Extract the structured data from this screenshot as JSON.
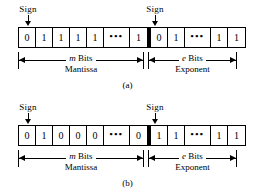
{
  "figure": {
    "background_color": "#ffffff",
    "ink_color": "#000000"
  },
  "diagrams": [
    {
      "caption": "(a)",
      "sign_labels": {
        "mantissa_sign": "Sign",
        "exponent_sign": "Sign"
      },
      "mantissa": {
        "bits": [
          "0",
          "1",
          "1",
          "1",
          "1",
          "•••",
          "1"
        ],
        "dimension_label_top_italic": "m",
        "dimension_label_top_rest": " Bits",
        "dimension_label_bottom": "Mantissa"
      },
      "exponent": {
        "bits": [
          "0",
          "1",
          "•••",
          "1",
          "1"
        ],
        "dimension_label_top_italic": "e",
        "dimension_label_top_rest": " Bits",
        "dimension_label_bottom": "Exponent"
      }
    },
    {
      "caption": "(b)",
      "sign_labels": {
        "mantissa_sign": "Sign",
        "exponent_sign": "Sign"
      },
      "mantissa": {
        "bits": [
          "0",
          "1",
          "0",
          "0",
          "0",
          "•••",
          "0"
        ],
        "dimension_label_top_italic": "m",
        "dimension_label_top_rest": " Bits",
        "dimension_label_bottom": "Mantissa"
      },
      "exponent": {
        "bits": [
          "1",
          "1",
          "•••",
          "1",
          "1"
        ],
        "dimension_label_top_italic": "e",
        "dimension_label_top_rest": " Bits",
        "dimension_label_bottom": "Exponent"
      }
    }
  ]
}
